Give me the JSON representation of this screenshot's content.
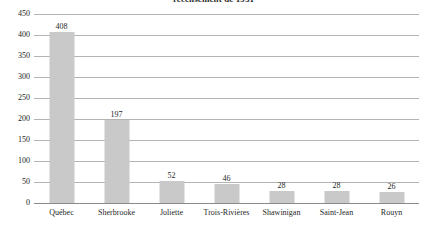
{
  "chart_data": {
    "type": "bar",
    "title": "recensement de 1931",
    "xlabel": "",
    "ylabel": "",
    "ylim": [
      0,
      450
    ],
    "ytick_step": 50,
    "yticks": [
      "0",
      "50",
      "100",
      "150",
      "200",
      "250",
      "300",
      "350",
      "400",
      "450"
    ],
    "grid": true,
    "legend": "none",
    "bar_color": "#c9c9c9",
    "categories": [
      "Québec",
      "Sherbrooke",
      "Joliette",
      "Trois-Rivières",
      "Shawinigan",
      "Saint-Jean",
      "Rouyn"
    ],
    "values": [
      408,
      197,
      52,
      46,
      28,
      28,
      26
    ],
    "value_labels": [
      "408",
      "197",
      "52",
      "46",
      "28",
      "28",
      "26"
    ]
  }
}
